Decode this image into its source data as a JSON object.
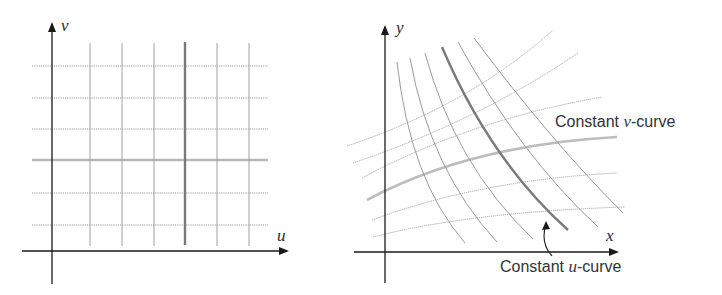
{
  "left_panel": {
    "axis_labels": {
      "horizontal": "u",
      "vertical": "v"
    },
    "vertical_lines_x": [
      90,
      122,
      154,
      185,
      217,
      249
    ],
    "highlighted_vertical_index": 3,
    "horizontal_lines_y": [
      66,
      98,
      129,
      160,
      193,
      225
    ],
    "highlighted_horizontal_index": 3
  },
  "right_panel": {
    "axis_labels": {
      "horizontal": "x",
      "vertical": "y"
    },
    "constant_v_label": {
      "prefix": "Constant ",
      "var": "v",
      "suffix": "-curve"
    },
    "constant_u_label": {
      "prefix": "Constant ",
      "var": "u",
      "suffix": "-curve"
    }
  },
  "colors": {
    "axis": "#1a1a1a",
    "grid": "#9a9a9a",
    "highlight_u": "#7a7a7a",
    "highlight_v": "#bdbdbd"
  }
}
